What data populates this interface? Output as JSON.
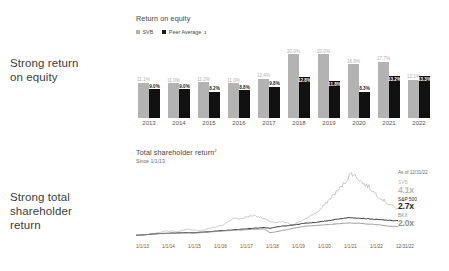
{
  "headlines": {
    "roe": "Strong return\non equity",
    "tsr": "Strong total\nshareholder\nreturn"
  },
  "roe_panel": {
    "title": "Return on equity",
    "legend": [
      {
        "label": "SVB",
        "color": "#b3b3b3"
      },
      {
        "label": "Peer Average",
        "sup": "1",
        "color": "#111111"
      }
    ]
  },
  "tsr_panel": {
    "title": "Total shareholder return",
    "title_sup": "2",
    "subtitle": "Since 1/1/13",
    "as_of": "As of 12/31/22",
    "legend": [
      {
        "name": "SVB",
        "value": "4.1x",
        "color": "#b9b9b9"
      },
      {
        "name": "S&P 500",
        "value": "2.7x",
        "color": "#1d1d1d"
      },
      {
        "name": "BKX",
        "value": "2.0x",
        "color": "#8f8f8f"
      }
    ]
  },
  "chart_data": [
    {
      "type": "bar",
      "title": "Return on equity",
      "xlabel": "",
      "ylabel": "Return on equity (%)",
      "ylim": [
        0,
        22
      ],
      "grid": false,
      "legend_position": "top-left",
      "categories": [
        "2013",
        "2014",
        "2015",
        "2016",
        "2017",
        "2018",
        "2019",
        "2020",
        "2021",
        "2022"
      ],
      "series": [
        {
          "name": "SVB",
          "color": "#b3b3b3",
          "values": [
            11.1,
            11.0,
            11.2,
            11.0,
            12.4,
            20.0,
            20.0,
            16.9,
            17.7,
            12.1
          ],
          "labels": [
            "11.1%",
            "11.0%",
            "11.2%",
            "11.0%",
            "12.4%",
            "20.0%",
            "20.0%",
            "16.9%",
            "17.7%",
            "12.1%"
          ]
        },
        {
          "name": "Peer Average",
          "color": "#111111",
          "values": [
            9.0,
            9.0,
            8.2,
            8.8,
            9.8,
            12.8,
            11.8,
            8.3,
            13.2,
            13.3
          ],
          "labels": [
            "9.0%",
            "9.0%",
            "8.2%",
            "8.8%",
            "9.8%",
            "12.8%",
            "11.8%",
            "8.3%",
            "13.2%",
            "13.3%"
          ]
        }
      ]
    },
    {
      "type": "line",
      "title": "Total shareholder return",
      "subtitle": "Since 1/1/13",
      "xlabel": "",
      "ylabel": "Cumulative return (x)",
      "ylim": [
        0,
        9
      ],
      "grid": false,
      "legend_position": "right",
      "annotation": "As of 12/31/22",
      "x": [
        "1/1/13",
        "1/1/14",
        "1/1/15",
        "1/1/16",
        "1/1/17",
        "1/1/18",
        "1/1/19",
        "1/1/20",
        "1/1/21",
        "1/1/22",
        "12/31/22"
      ],
      "series": [
        {
          "name": "SVB",
          "color": "#b9b9b9",
          "end_value": "4.1x",
          "values": [
            1.0,
            1.0,
            1.1,
            1.2,
            1.3,
            1.5,
            1.5,
            1.4,
            1.6,
            1.7,
            1.6,
            1.5,
            1.7,
            1.9,
            2.0,
            2.2,
            2.7,
            3.0,
            2.9,
            3.1,
            3.3,
            3.2,
            2.9,
            2.6,
            2.4,
            2.6,
            2.4,
            2.2,
            2.6,
            2.8,
            3.3,
            3.6,
            4.2,
            5.0,
            5.7,
            6.4,
            7.2,
            8.2,
            7.7,
            7.0,
            6.6,
            5.9,
            5.3,
            4.8,
            4.4,
            4.1
          ]
        },
        {
          "name": "S&P 500",
          "color": "#1d1d1d",
          "end_value": "2.7x",
          "values": [
            1.0,
            1.05,
            1.1,
            1.15,
            1.2,
            1.22,
            1.25,
            1.28,
            1.3,
            1.32,
            1.3,
            1.35,
            1.4,
            1.45,
            1.5,
            1.55,
            1.6,
            1.65,
            1.7,
            1.75,
            1.8,
            1.85,
            1.9,
            1.8,
            1.95,
            2.05,
            2.1,
            2.2,
            2.3,
            2.4,
            2.45,
            2.5,
            2.6,
            2.7,
            2.8,
            2.9,
            3.0,
            3.05,
            3.0,
            2.95,
            2.9,
            2.85,
            2.8,
            2.75,
            2.7,
            2.7
          ]
        },
        {
          "name": "BKX",
          "color": "#8f8f8f",
          "end_value": "2.0x",
          "values": [
            1.0,
            1.05,
            1.1,
            1.15,
            1.2,
            1.2,
            1.22,
            1.25,
            1.25,
            1.28,
            1.25,
            1.3,
            1.35,
            1.4,
            1.45,
            1.5,
            1.55,
            1.6,
            1.62,
            1.65,
            1.7,
            1.72,
            1.75,
            1.3,
            1.4,
            1.55,
            1.65,
            1.8,
            1.95,
            2.05,
            2.1,
            2.15,
            2.2,
            2.25,
            2.3,
            2.35,
            2.4,
            2.42,
            2.4,
            2.35,
            2.3,
            2.25,
            2.2,
            2.1,
            2.05,
            2.0
          ]
        }
      ]
    }
  ]
}
